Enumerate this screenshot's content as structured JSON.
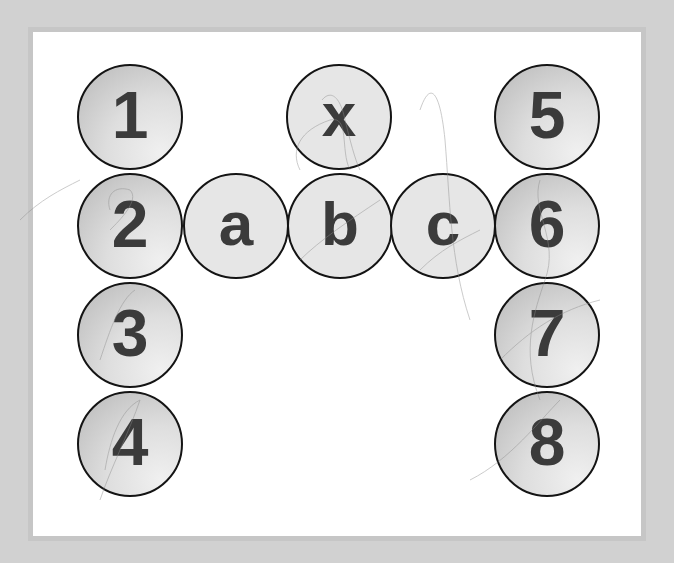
{
  "board": {
    "background_color": "#ffffff",
    "frame_color": "#c6c6c6",
    "page_color": "#d1d1d1",
    "tile_border_color": "#141414",
    "glyph_color": "#3b3b3b"
  },
  "tiles": {
    "left_column": [
      {
        "label": "1"
      },
      {
        "label": "2"
      },
      {
        "label": "3"
      },
      {
        "label": "4"
      }
    ],
    "right_column": [
      {
        "label": "5"
      },
      {
        "label": "6"
      },
      {
        "label": "7"
      },
      {
        "label": "8"
      }
    ],
    "middle_row": [
      {
        "label": "a"
      },
      {
        "label": "b"
      },
      {
        "label": "c"
      }
    ],
    "top_middle": {
      "label": "x"
    }
  }
}
